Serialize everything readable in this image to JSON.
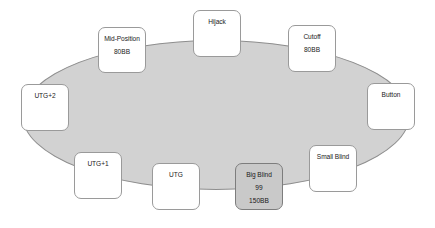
{
  "diagram": {
    "table": {
      "name": "poker-table-felt",
      "fill_color": "#d2d2d2",
      "border_color": "#8e8e8e",
      "shape": "ellipse",
      "left": 22,
      "top": 40,
      "width": 388,
      "height": 150
    },
    "seat_style": {
      "fill_color": "#ffffff",
      "border_color": "#9a9a9a",
      "hero_fill_color": "#c9c9c9",
      "hero_border_color": "#7d7d7d",
      "text_color": "#1a1a1a"
    },
    "seats": [
      {
        "id": "mid-position",
        "label": "Mid-Position",
        "hand": "",
        "stack": "80BB",
        "hero": false,
        "left": 98,
        "top": 27,
        "width": 48,
        "height": 46
      },
      {
        "id": "hijack",
        "label": "Hijack",
        "hand": "",
        "stack": "",
        "hero": false,
        "left": 193,
        "top": 10,
        "width": 48,
        "height": 47
      },
      {
        "id": "cutoff",
        "label": "Cutoff",
        "hand": "",
        "stack": "80BB",
        "hero": false,
        "left": 288,
        "top": 25,
        "width": 48,
        "height": 47
      },
      {
        "id": "utg-plus-2",
        "label": "UTG+2",
        "hand": "",
        "stack": "",
        "hero": false,
        "left": 21,
        "top": 84,
        "width": 48,
        "height": 47
      },
      {
        "id": "button",
        "label": "Button",
        "hand": "",
        "stack": "",
        "hero": false,
        "left": 367,
        "top": 83,
        "width": 48,
        "height": 47
      },
      {
        "id": "utg-plus-1",
        "label": "UTG+1",
        "hand": "",
        "stack": "",
        "hero": false,
        "left": 74,
        "top": 152,
        "width": 48,
        "height": 47
      },
      {
        "id": "small-blind",
        "label": "Small Blind",
        "hand": "",
        "stack": "",
        "hero": false,
        "left": 309,
        "top": 145,
        "width": 48,
        "height": 47
      },
      {
        "id": "utg",
        "label": "UTG",
        "hand": "",
        "stack": "",
        "hero": false,
        "left": 152,
        "top": 163,
        "width": 48,
        "height": 47
      },
      {
        "id": "big-blind",
        "label": "Big Blind",
        "hand": "99",
        "stack": "150BB",
        "hero": true,
        "left": 235,
        "top": 163,
        "width": 48,
        "height": 47
      }
    ]
  }
}
